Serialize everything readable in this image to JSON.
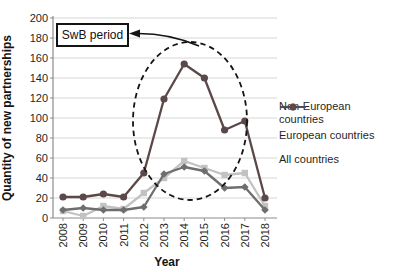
{
  "chart_data": {
    "type": "line",
    "title": "",
    "xlabel": "Year",
    "ylabel": "Quantity of new partnerships",
    "x": [
      "2008",
      "2009",
      "2010",
      "2011",
      "2012",
      "2013",
      "2014",
      "2015",
      "2016",
      "2017",
      "2018"
    ],
    "ylim": [
      0,
      200
    ],
    "yticks": [
      0,
      20,
      40,
      60,
      80,
      100,
      120,
      140,
      160,
      180,
      200
    ],
    "grid": true,
    "legend_position": "right",
    "annotation": {
      "text": "SwB period",
      "target": "dashed ellipse circling the 2013-2016 peak"
    },
    "series": [
      {
        "name": "Non-European countries",
        "marker": "square",
        "color": "#c2c2c2",
        "values": [
          7,
          2,
          12,
          9,
          25,
          40,
          57,
          50,
          43,
          45,
          12
        ]
      },
      {
        "name": "European countries",
        "marker": "diamond",
        "color": "#6e6e6e",
        "values": [
          8,
          10,
          8,
          8,
          11,
          44,
          51,
          47,
          30,
          31,
          8
        ]
      },
      {
        "name": "All countries",
        "marker": "circle",
        "color": "#5b4848",
        "values": [
          21,
          21,
          24,
          21,
          45,
          119,
          154,
          140,
          88,
          97,
          20
        ]
      }
    ]
  },
  "colors": {
    "gridline": "#d6d6d6",
    "axis": "#8c8c8c",
    "text": "#1f1f1f",
    "annotation": "#141414",
    "background": "#ffffff"
  }
}
